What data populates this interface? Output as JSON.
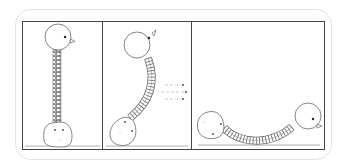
{
  "diagram": {
    "title": "",
    "panels": [
      {
        "id": "panel-1",
        "state": "upright",
        "description": "head on vertical spring above body"
      },
      {
        "id": "panel-2",
        "state": "bending",
        "description": "spring curving, motion arrows pointing right"
      },
      {
        "id": "panel-3",
        "state": "lying",
        "description": "head and body on floor connected by sagging spring"
      }
    ],
    "colors": {
      "stroke": "#555555",
      "frame": "#444444",
      "outer_border": "#e2e2e2",
      "floor": "#999999",
      "eye": "#222222",
      "arrow": "#888888"
    }
  }
}
